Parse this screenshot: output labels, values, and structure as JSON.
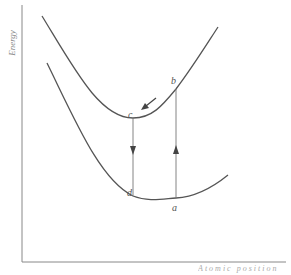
{
  "diagram": {
    "y_axis_label": "Energy",
    "x_axis_label": "Atomic position",
    "curves": [
      {
        "name": "excited-state-curve",
        "description": "upper potential energy curve"
      },
      {
        "name": "ground-state-curve",
        "description": "lower potential energy curve"
      }
    ],
    "points": {
      "a": "a",
      "b": "b",
      "c": "c",
      "d": "d"
    },
    "transitions": [
      {
        "from": "a",
        "to": "b",
        "direction": "up",
        "meaning": "absorption"
      },
      {
        "from": "b",
        "to": "c",
        "direction": "along upper curve",
        "meaning": "relaxation"
      },
      {
        "from": "c",
        "to": "d",
        "direction": "down",
        "meaning": "emission"
      }
    ],
    "colors": {
      "axis": "#888888",
      "curve": "#555555",
      "transition_line": "#777777",
      "label": "#555555"
    }
  }
}
